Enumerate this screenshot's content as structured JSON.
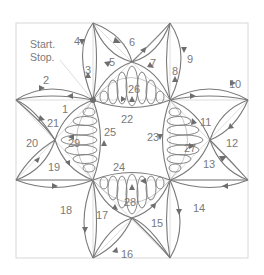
{
  "diagram": {
    "start_label_line1": "Start.",
    "start_label_line2": "Stop.",
    "colors": {
      "line": "#7a7a7a",
      "guide": "#d4d4d4",
      "frame": "#d8d8d8",
      "background": "#ffffff"
    },
    "path_labels": [
      "1",
      "2",
      "3",
      "4",
      "5",
      "6",
      "7",
      "8",
      "9",
      "10",
      "11",
      "12",
      "13",
      "14",
      "15",
      "16",
      "17",
      "18",
      "19",
      "20",
      "21",
      "22",
      "23",
      "24",
      "25",
      "26",
      "27",
      "28",
      "29"
    ]
  }
}
